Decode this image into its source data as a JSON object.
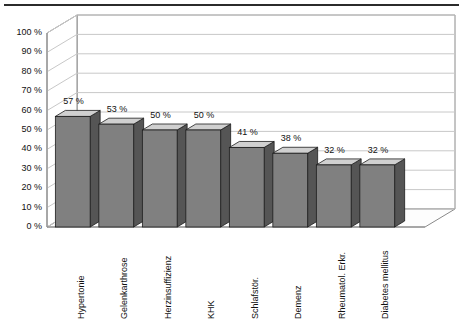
{
  "chart_data": {
    "type": "bar",
    "title": "",
    "subtitle": "",
    "xlabel": "",
    "ylabel": "",
    "categories": [
      "Hypertonie",
      "Gelenkarthrose",
      "Herzinsuffizienz",
      "KHK",
      "Schlafstör.",
      "Demenz",
      "Rheumatol. Erkr.",
      "Diabetes mellitus"
    ],
    "values": [
      57,
      53,
      50,
      50,
      41,
      38,
      32,
      32
    ],
    "data_labels": [
      "57 %",
      "53 %",
      "50 %",
      "50 %",
      "41 %",
      "38 %",
      "32 %",
      "32 %"
    ],
    "ylim": [
      0,
      100
    ],
    "ytick_values": [
      0,
      10,
      20,
      30,
      40,
      50,
      60,
      70,
      80,
      90,
      100
    ],
    "ytick_labels": [
      "0 %",
      "10 %",
      "20 %",
      "30 %",
      "40 %",
      "50 %",
      "60 %",
      "70 %",
      "80 %",
      "90 %",
      "100 %"
    ],
    "grid": true,
    "legend": false,
    "style": "3d-column",
    "colors": {
      "bar_front": "#808080",
      "bar_top": "#d0d0d0",
      "bar_side": "#555555",
      "bar_outline": "#1c1c1c",
      "gridline": "#c8c8c8",
      "axis": "#8a8a8a",
      "floor": "#fdfdfd",
      "wall": "#ffffff",
      "rule": "#2b2b2b",
      "text": "#111111"
    }
  }
}
